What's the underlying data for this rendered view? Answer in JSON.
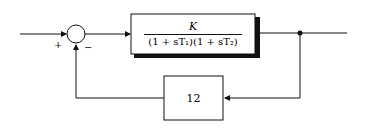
{
  "diagram": {
    "type": "feedback block diagram",
    "summing_junction": {
      "signs": {
        "input": "+",
        "feedback": "−"
      }
    },
    "forward_block": {
      "numerator": "K",
      "denominator": "(1 + sT₁)(1 + sT₂)"
    },
    "feedback_block": {
      "gain": "12"
    },
    "colors": {
      "line": "#111111",
      "background": "#ffffff"
    }
  }
}
